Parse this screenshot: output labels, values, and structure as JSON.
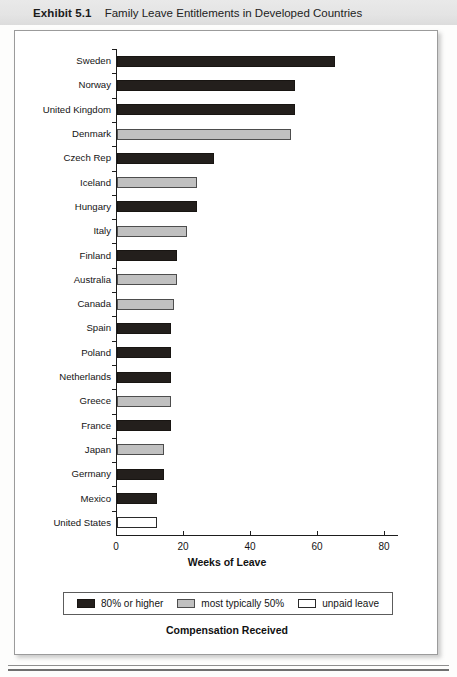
{
  "header": {
    "exhibit_label": "Exhibit 5.1",
    "title": "Family Leave Entitlements in Developed Countries"
  },
  "chart_data": {
    "type": "bar",
    "orientation": "horizontal",
    "title": "Family Leave Entitlements in Developed Countries",
    "xlabel": "Weeks of Leave",
    "ylabel": "",
    "xlim": [
      0,
      80
    ],
    "xticks": [
      0,
      20,
      40,
      60,
      80
    ],
    "grid": false,
    "legend_position": "bottom",
    "legend_title": "Compensation Received",
    "categories": [
      "Sweden",
      "Norway",
      "United Kingdom",
      "Denmark",
      "Czech Rep",
      "Iceland",
      "Hungary",
      "Italy",
      "Finland",
      "Australia",
      "Canada",
      "Spain",
      "Poland",
      "Netherlands",
      "Greece",
      "France",
      "Japan",
      "Germany",
      "Mexico",
      "United States"
    ],
    "values": [
      65,
      53,
      53,
      52,
      29,
      24,
      24,
      21,
      18,
      18,
      17,
      16,
      16,
      16,
      16,
      16,
      14,
      14,
      12,
      12
    ],
    "groups": [
      "high",
      "high",
      "high",
      "mid",
      "high",
      "mid",
      "high",
      "mid",
      "high",
      "mid",
      "mid",
      "high",
      "high",
      "high",
      "mid",
      "high",
      "mid",
      "high",
      "high",
      "unpaid"
    ],
    "legend": [
      {
        "key": "high",
        "label": "80% or higher",
        "color": "#231f1c"
      },
      {
        "key": "mid",
        "label": "most typically 50%",
        "color": "#c0c0c0"
      },
      {
        "key": "unpaid",
        "label": "unpaid leave",
        "color": "#ffffff"
      }
    ]
  }
}
